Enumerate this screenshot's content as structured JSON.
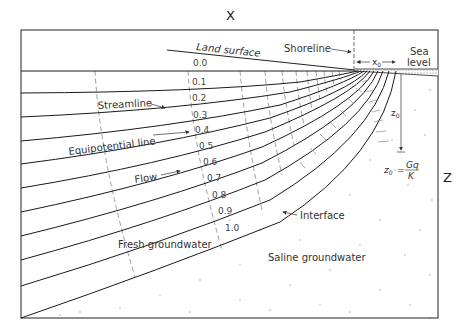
{
  "diagram": {
    "axis_x_label": "X",
    "axis_z_label": "Z",
    "labels": {
      "land_surface": "Land surface",
      "shoreline": "Shoreline",
      "sea_level_line1": "Sea",
      "sea_level_line2": "level",
      "x0": "x",
      "x0_sub": "0",
      "z0": "z",
      "z0_sub": "0",
      "streamline": "Streamline",
      "equipotential_line": "Equipotential line",
      "flow": "Flow",
      "interface": "Interface",
      "fresh_groundwater": "Fresh groundwater",
      "saline_groundwater": "Saline groundwater"
    },
    "formula": {
      "lhs": "z",
      "lhs_sub": "0",
      "equals": "=",
      "numerator": "Gq",
      "denominator": "K"
    },
    "streamline_values": [
      "0.0",
      "0.1",
      "0.2",
      "0.3",
      "0.4",
      "0.5",
      "0.6",
      "0.7",
      "0.8",
      "0.9",
      "1.0"
    ],
    "colors": {
      "line": "#1a1a1a",
      "dashed": "#666666",
      "text": "#333333",
      "saline_dots": "#888888"
    }
  }
}
